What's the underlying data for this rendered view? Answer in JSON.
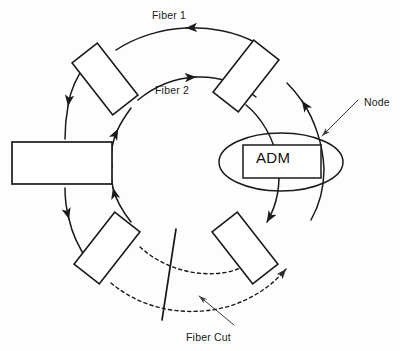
{
  "figure": {
    "background_color": "#fdfdfd",
    "line_color": "#1a1a1a"
  },
  "labels": {
    "fiber1": "Fiber 1",
    "fiber2": "Fiber 2",
    "node": "Node",
    "fiber_cut": "Fiber Cut",
    "adm": "ADM"
  },
  "ring": {
    "center_x": 196,
    "center_y": 163,
    "outer_radius": 128,
    "inner_radius": 92,
    "fiber1_direction": "counterclockwise",
    "fiber2_direction": "clockwise",
    "fiber1_arrow": "left",
    "fiber2_arrow": "right"
  },
  "nodes": [
    {
      "id": "node-left",
      "shape": "rectangle",
      "label": "",
      "rotation_deg": 0,
      "cx": 62,
      "cy": 163
    },
    {
      "id": "node-top-left",
      "shape": "rectangle",
      "label": "",
      "rotation_deg": 52,
      "cx": 105,
      "cy": 79
    },
    {
      "id": "node-top-right",
      "shape": "rectangle",
      "label": "",
      "rotation_deg": -52,
      "cx": 246,
      "cy": 75
    },
    {
      "id": "node-adm",
      "shape": "ellipse-rectangle",
      "label": "ADM",
      "rotation_deg": 0,
      "cx": 281,
      "cy": 162
    },
    {
      "id": "node-bottom-right",
      "shape": "rectangle",
      "label": "",
      "rotation_deg": 52,
      "cx": 245,
      "cy": 248
    },
    {
      "id": "node-bottom-left",
      "shape": "rectangle",
      "label": "",
      "rotation_deg": -52,
      "cx": 107,
      "cy": 248
    }
  ],
  "annotations": {
    "node_pointer": {
      "from_x": 358,
      "from_y": 100,
      "to_x": 322,
      "to_y": 136
    },
    "cut_pointer": {
      "from_x": 232,
      "from_y": 324,
      "to_x": 198,
      "to_y": 296
    },
    "cut_line": {
      "x1": 176,
      "y1": 229,
      "x2": 162,
      "y2": 320
    }
  },
  "protection_path": {
    "style": "dashed",
    "description": "Dashed arcs across the lower ring span between bottom-left and bottom-right nodes"
  }
}
